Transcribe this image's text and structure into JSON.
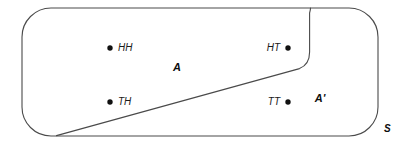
{
  "diagram": {
    "type": "venn-set-diagram",
    "sample_space": {
      "label": "S",
      "label_x": 384,
      "label_y": 132
    },
    "regions": [
      {
        "id": "A",
        "label": "A",
        "label_x": 177,
        "label_y": 71,
        "description": "region left of dividing curve"
      },
      {
        "id": "Ap",
        "label": "A'",
        "label_x": 320,
        "label_y": 102,
        "description": "complement region right of dividing curve"
      }
    ],
    "outcomes": [
      {
        "id": "HH",
        "label": "HH",
        "dot_x": 110,
        "dot_y": 48,
        "label_x": 118,
        "label_y": 51,
        "label_side": "right",
        "region": "A"
      },
      {
        "id": "HT",
        "label": "HT",
        "dot_x": 288,
        "dot_y": 48,
        "label_x": 280,
        "label_y": 51,
        "label_side": "left",
        "region": "A"
      },
      {
        "id": "TH",
        "label": "TH",
        "dot_x": 110,
        "dot_y": 102,
        "label_x": 118,
        "label_y": 105,
        "label_side": "right",
        "region": "A"
      },
      {
        "id": "TT",
        "label": "TT",
        "dot_x": 288,
        "dot_y": 102,
        "label_x": 280,
        "label_y": 105,
        "label_side": "left",
        "region": "Ap"
      }
    ],
    "colors": {
      "stroke": "#4a4a4a",
      "fill": "#ffffff",
      "dot": "#111111",
      "text": "#1a1a1a"
    },
    "geometry": {
      "rect_left": 22,
      "rect_top": 8,
      "rect_right": 378,
      "rect_bottom": 136,
      "corner_radius": 29,
      "divider_start_x": 56,
      "divider_start_y": 136,
      "divider_end_x": 310,
      "divider_end_y": 68,
      "notch_x": 310,
      "notch_top_y": 8
    }
  }
}
